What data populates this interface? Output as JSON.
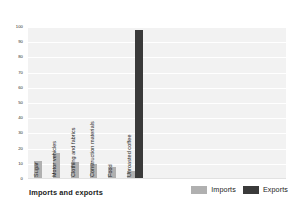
{
  "chart_data": {
    "type": "bar",
    "title": "Imports and exports",
    "xlabel": "",
    "ylabel": "Percentage of total",
    "ylim": [
      0,
      100
    ],
    "ytick_labels": [
      "100",
      "90",
      "80",
      "70",
      "60",
      "50",
      "40",
      "30",
      "20",
      "10",
      "0"
    ],
    "ytick_values": [
      100,
      90,
      80,
      70,
      60,
      50,
      40,
      30,
      20,
      10,
      0
    ],
    "grid": true,
    "legend_position": "bottom-right",
    "categories": [
      "Sugar",
      "Motor vehicles",
      "Clothing and fabrics",
      "Construction materials",
      "Food",
      "Unroasted coffee"
    ],
    "series": [
      {
        "name": "Imports",
        "color": "#b0b0b0",
        "values": [
          12,
          17,
          11,
          10,
          8,
          5
        ]
      },
      {
        "name": "Exports",
        "color": "#3a3a3a",
        "values": [
          0,
          0,
          0,
          0,
          0,
          98
        ]
      }
    ]
  },
  "legend": {
    "entries": [
      {
        "label": "Imports",
        "swatch": "imports-swatch"
      },
      {
        "label": "Exports",
        "swatch": "exports-swatch"
      }
    ]
  },
  "colors": {
    "imports": "#b0b0b0",
    "exports": "#3a3a3a",
    "plot_background": "#f2f2f2",
    "gridline": "#ffffff",
    "page_background": "#ffffff",
    "text": "#1b1b1b"
  }
}
